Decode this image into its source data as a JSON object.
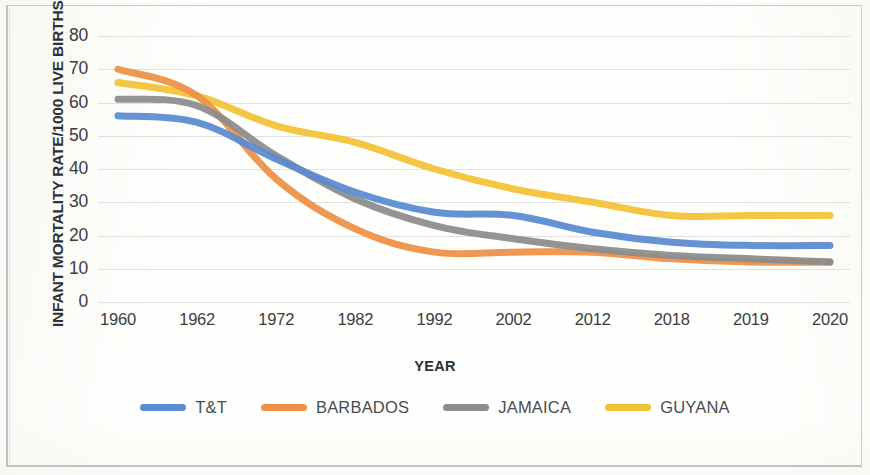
{
  "chart_data": {
    "type": "line",
    "title": "",
    "xlabel": "YEAR",
    "ylabel": "INFANT MORTALITY RATE/1000 LIVE BIRTHS",
    "categories": [
      "1960",
      "1962",
      "1972",
      "1982",
      "1992",
      "2002",
      "2012",
      "2018",
      "2019",
      "2020"
    ],
    "yticks": [
      80,
      70,
      60,
      50,
      40,
      30,
      20,
      10,
      0
    ],
    "ylim": [
      0,
      80
    ],
    "grid": true,
    "legend_position": "bottom",
    "series": [
      {
        "name": "T&T",
        "color": "#5b8bd0",
        "values": [
          56,
          54,
          43,
          33,
          27,
          26,
          21,
          18,
          17,
          17
        ]
      },
      {
        "name": "BARBADOS",
        "color": "#ed9248",
        "values": [
          70,
          62,
          37,
          22,
          15,
          15,
          15,
          13,
          12,
          12
        ]
      },
      {
        "name": "JAMAICA",
        "color": "#8d8d8d",
        "values": [
          61,
          59,
          44,
          31,
          23,
          19,
          16,
          14,
          13,
          12
        ]
      },
      {
        "name": "GUYANA",
        "color": "#f2c337",
        "values": [
          66,
          62,
          53,
          48,
          40,
          34,
          30,
          26,
          26,
          26
        ]
      }
    ]
  },
  "axis": {
    "y_title": "INFANT MORTALITY RATE/1000 LIVE BIRTHS",
    "x_title": "YEAR"
  },
  "legend": {
    "items": [
      {
        "label": "T&T",
        "color": "#5b8bd0",
        "swatch_name": "legend-swatch-tt"
      },
      {
        "label": "BARBADOS",
        "color": "#ed9248",
        "swatch_name": "legend-swatch-barbados"
      },
      {
        "label": "JAMAICA",
        "color": "#8d8d8d",
        "swatch_name": "legend-swatch-jamaica"
      },
      {
        "label": "GUYANA",
        "color": "#f2c337",
        "swatch_name": "legend-swatch-guyana"
      }
    ]
  }
}
